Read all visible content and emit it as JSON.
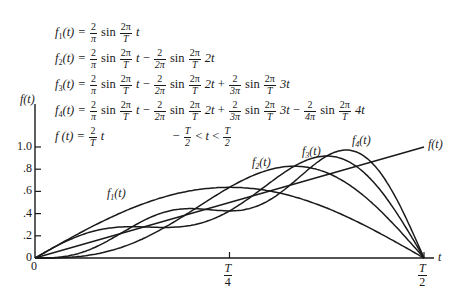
{
  "equations": [
    {
      "lhs": "f",
      "sub": "1",
      "var": "(t) =",
      "terms": "2/π sin 2π/T t"
    },
    {
      "lhs": "f",
      "sub": "2",
      "var": "(t) =",
      "terms": "2/π sin 2π/T t − 2/2π sin 2π/T 2t"
    },
    {
      "lhs": "f",
      "sub": "3",
      "var": "(t) =",
      "terms": "2/π sin 2π/T t − 2/2π sin 2π/T 2t + 2/3π sin 2π/T 3t"
    },
    {
      "lhs": "f",
      "sub": "4",
      "var": "(t) =",
      "terms": "2/π sin 2π/T t − 2/2π sin 2π/T 2t + 2/3π sin 2π/T 3t − 2/4π sin 2π/T 4t"
    },
    {
      "lhs": "f",
      "var": "(t) =",
      "terms": "2/T t",
      "domain": "− T/2 < t < T/2"
    }
  ],
  "text": {
    "sin": "sin",
    "two": "2",
    "pi": "π",
    "two_pi": "2π",
    "T": "T",
    "t": "t",
    "two_t": "2t",
    "three_t": "3t",
    "four_t": "4t",
    "minus": "−",
    "plus": "+",
    "lt": "<",
    "f": "f",
    "eq_var": "(t) =",
    "den2": "2π",
    "den3": "3π",
    "den4": "4π",
    "half_den": "2",
    "s1": "1",
    "s2": "2",
    "s3": "3",
    "s4": "4"
  },
  "chart_data": {
    "type": "line",
    "title": "",
    "xlabel": "t",
    "ylabel": "f(t)",
    "xlim": [
      0,
      0.5
    ],
    "ylim": [
      0,
      1.0
    ],
    "x_ticks": [
      {
        "value": 0,
        "label": "0"
      },
      {
        "value": 0.25,
        "label": "T/4"
      },
      {
        "value": 0.5,
        "label": "T/2"
      }
    ],
    "y_ticks": [
      {
        "value": 0,
        "label": "0"
      },
      {
        "value": 0.2,
        "label": ".2"
      },
      {
        "value": 0.4,
        "label": ".4"
      },
      {
        "value": 0.6,
        "label": ".6"
      },
      {
        "value": 0.8,
        "label": ".8"
      },
      {
        "value": 1.0,
        "label": "1.0"
      }
    ],
    "grid": false,
    "legend": "inline labels on curves",
    "x_units": "fraction of period T",
    "series": [
      {
        "name": "f1(t)",
        "harmonics": 1,
        "label_pos": [
          107,
          200
        ],
        "x": [
          0,
          0.0625,
          0.125,
          0.1875,
          0.25,
          0.3125,
          0.375,
          0.4375,
          0.5
        ],
        "values": [
          0,
          0.244,
          0.45,
          0.588,
          0.637,
          0.588,
          0.45,
          0.244,
          0
        ]
      },
      {
        "name": "f2(t)",
        "harmonics": 2,
        "label_pos": [
          252,
          169
        ],
        "x": [
          0,
          0.0625,
          0.125,
          0.1875,
          0.25,
          0.3125,
          0.375,
          0.4375,
          0.5
        ],
        "values": [
          0,
          0.019,
          0.132,
          0.363,
          0.637,
          0.813,
          0.768,
          0.469,
          0
        ]
      },
      {
        "name": "f3(t)",
        "harmonics": 3,
        "label_pos": [
          302,
          158
        ],
        "x": [
          0,
          0.0625,
          0.125,
          0.1875,
          0.25,
          0.3125,
          0.375,
          0.4375,
          0.5
        ],
        "values": [
          0,
          0.217,
          0.282,
          0.285,
          0.425,
          0.615,
          0.918,
          0.667,
          0
        ]
      },
      {
        "name": "f4(t)",
        "harmonics": 4,
        "label_pos": [
          352,
          147
        ],
        "x": [
          0,
          0.0625,
          0.125,
          0.1875,
          0.25,
          0.3125,
          0.375,
          0.4375,
          0.5
        ],
        "values": [
          0,
          0.058,
          0.282,
          0.443,
          0.425,
          0.456,
          0.918,
          0.828,
          0
        ]
      },
      {
        "name": "f(t)",
        "formula": "2t/T",
        "label_pos": [
          428,
          151
        ],
        "x": [
          0,
          0.25,
          0.5
        ],
        "values": [
          0,
          0.5,
          1.0
        ]
      }
    ]
  },
  "colors": {
    "ink": "#1a1a1a",
    "background": "#ffffff"
  }
}
